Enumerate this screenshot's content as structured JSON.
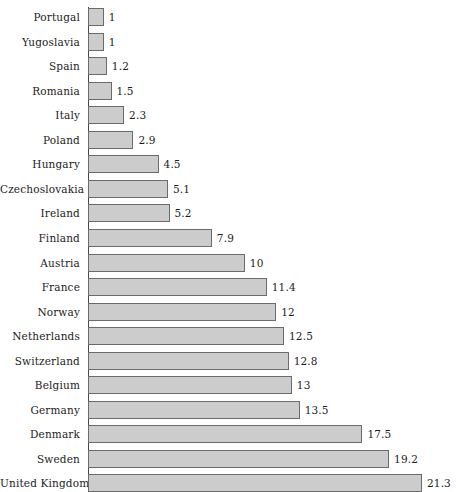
{
  "chart_data": {
    "type": "bar",
    "orientation": "horizontal",
    "title": "",
    "subtitle": "",
    "xlabel": "",
    "ylabel": "",
    "xlim": [
      0,
      21.3
    ],
    "grid": false,
    "legend": null,
    "categories": [
      "Portugal",
      "Yugoslavia",
      "Spain",
      "Romania",
      "Italy",
      "Poland",
      "Hungary",
      "Czechoslovakia",
      "Ireland",
      "Finland",
      "Austria",
      "France",
      "Norway",
      "Netherlands",
      "Switzerland",
      "Belgium",
      "Germany",
      "Denmark",
      "Sweden",
      "United Kingdom"
    ],
    "values": [
      1,
      1,
      1.2,
      1.5,
      2.3,
      2.9,
      4.5,
      5.1,
      5.2,
      7.9,
      10,
      11.4,
      12,
      12.5,
      12.8,
      13,
      13.5,
      17.5,
      19.2,
      21.3
    ],
    "value_labels": [
      "1",
      "1",
      "1.2",
      "1.5",
      "2.3",
      "2.9",
      "4.5",
      "5.1",
      "5.2",
      "7.9",
      "10",
      "11.4",
      "12",
      "12.5",
      "12.8",
      "13",
      "13.5",
      "17.5",
      "19.2",
      "21.3"
    ],
    "colors": {
      "bar_fill": "#cccccc",
      "bar_border": "#6b6b6b",
      "axis": "#4a4a4a",
      "text": "#1d1d1d",
      "background": "#ffffff"
    }
  }
}
